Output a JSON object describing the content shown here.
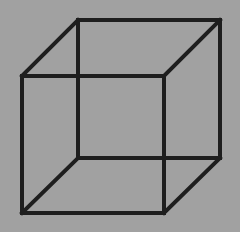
{
  "figure": {
    "background_color": "#a1a1a1",
    "border_color": "#ffffff",
    "line_color": "#1e1e1e",
    "line_width": 4
  },
  "cube": {
    "front_face": {
      "top_left": [
        22,
        76
      ],
      "top_right": [
        164,
        76
      ],
      "bottom_right": [
        164,
        213
      ],
      "bottom_left": [
        22,
        213
      ]
    },
    "back_face": {
      "top_left": [
        78,
        20
      ],
      "top_right": [
        220,
        20
      ],
      "bottom_right": [
        220,
        158
      ],
      "bottom_left": [
        78,
        158
      ]
    }
  }
}
